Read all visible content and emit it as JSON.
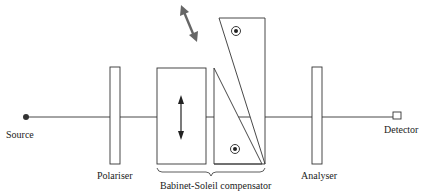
{
  "diagram": {
    "labels": {
      "source": "Source",
      "polariser": "Polariser",
      "compensator": "Babinet-Soleil compensator",
      "analyser": "Analyser",
      "detector": "Detector"
    },
    "colors": {
      "line": "#222222",
      "movement_arrow": "#666666"
    }
  }
}
